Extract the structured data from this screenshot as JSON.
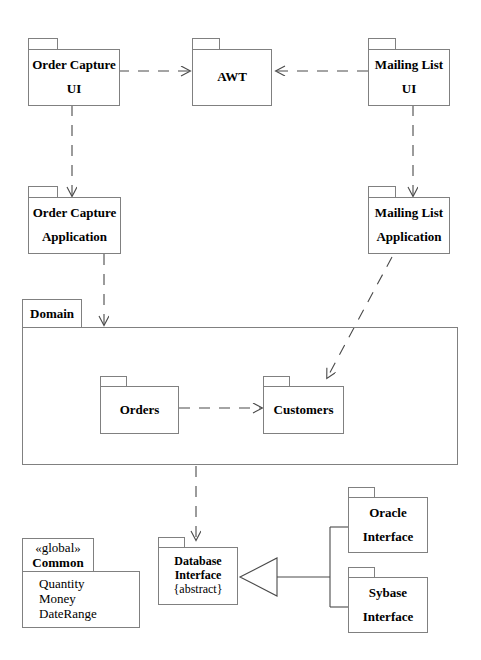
{
  "diagram": {
    "type": "uml-package-diagram",
    "title": "",
    "background_color": "#ffffff",
    "line_color": "#808080",
    "text_color": "#000000"
  },
  "packages": [
    {
      "id": "order-capture-ui",
      "name": "Order Capture UI",
      "line1": "Order Capture",
      "line2": "UI",
      "bold": true
    },
    {
      "id": "awt",
      "name": "AWT",
      "line1": "AWT",
      "line2": "",
      "bold": true
    },
    {
      "id": "mailing-list-ui",
      "name": "Mailing List UI",
      "line1": "Mailing List",
      "line2": "UI",
      "bold": true
    },
    {
      "id": "order-capture-application",
      "name": "Order Capture Application",
      "line1": "Order Capture",
      "line2": "Application",
      "bold": true
    },
    {
      "id": "mailing-list-application",
      "name": "Mailing List Application",
      "line1": "Mailing List",
      "line2": "Application",
      "bold": true
    },
    {
      "id": "orders",
      "name": "Orders",
      "line1": "Orders",
      "line2": "",
      "bold": true
    },
    {
      "id": "customers",
      "name": "Customers",
      "line1": "Customers",
      "line2": "",
      "bold": true
    },
    {
      "id": "database-interface",
      "name": "Database Interface {abstract}",
      "line1": "Database",
      "line2": "Interface",
      "line3": "{abstract}",
      "bold": true
    },
    {
      "id": "oracle-interface",
      "name": "Oracle Interface",
      "line1": "Oracle",
      "line2": "Interface",
      "bold": true
    },
    {
      "id": "sybase-interface",
      "name": "Sybase Interface",
      "line1": "Sybase",
      "line2": "Interface",
      "bold": true
    },
    {
      "id": "common",
      "name": "Common",
      "stereotype": "«global»",
      "line1": "Common",
      "members": [
        "Quantity",
        "Money",
        "DateRange"
      ],
      "bold": true
    }
  ],
  "domain": {
    "id": "domain",
    "label": "Domain",
    "contains": [
      "orders",
      "customers"
    ]
  },
  "common": {
    "stereotype": "«global»",
    "label": "Common",
    "member1": "Quantity",
    "member2": "Money",
    "member3": "DateRange"
  },
  "database_interface": {
    "line1": "Database",
    "line2": "Interface",
    "line3": "{abstract}"
  },
  "relationships": [
    {
      "from": "order-capture-ui",
      "to": "awt",
      "kind": "dependency",
      "style": "dashed",
      "arrow": "open"
    },
    {
      "from": "mailing-list-ui",
      "to": "awt",
      "kind": "dependency",
      "style": "dashed",
      "arrow": "open"
    },
    {
      "from": "order-capture-ui",
      "to": "order-capture-application",
      "kind": "dependency",
      "style": "dashed",
      "arrow": "open"
    },
    {
      "from": "mailing-list-ui",
      "to": "mailing-list-application",
      "kind": "dependency",
      "style": "dashed",
      "arrow": "open"
    },
    {
      "from": "order-capture-application",
      "to": "domain",
      "kind": "dependency",
      "style": "dashed",
      "arrow": "open"
    },
    {
      "from": "mailing-list-application",
      "to": "customers",
      "kind": "dependency",
      "style": "dashed",
      "arrow": "open"
    },
    {
      "from": "orders",
      "to": "customers",
      "kind": "dependency",
      "style": "dashed",
      "arrow": "open"
    },
    {
      "from": "domain",
      "to": "database-interface",
      "kind": "dependency",
      "style": "dashed",
      "arrow": "open"
    },
    {
      "from": "oracle-interface",
      "to": "database-interface",
      "kind": "generalization",
      "style": "solid",
      "arrow": "hollow-triangle"
    },
    {
      "from": "sybase-interface",
      "to": "database-interface",
      "kind": "generalization",
      "style": "solid",
      "arrow": "hollow-triangle"
    }
  ]
}
